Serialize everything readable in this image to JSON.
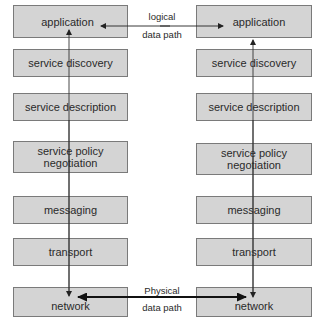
{
  "diagram": {
    "left_stack": {
      "layers": [
        {
          "label": "application"
        },
        {
          "label": "service discovery"
        },
        {
          "label": "service description"
        },
        {
          "label": "service policy\nnegotiation"
        },
        {
          "label": "messaging"
        },
        {
          "label": "transport"
        },
        {
          "label": "network"
        }
      ]
    },
    "right_stack": {
      "layers": [
        {
          "label": "application"
        },
        {
          "label": "service discovery"
        },
        {
          "label": "service description"
        },
        {
          "label": "service policy\nnegotiation"
        },
        {
          "label": "messaging"
        },
        {
          "label": "transport"
        },
        {
          "label": "network"
        }
      ]
    },
    "logical_path": {
      "line1": "logical",
      "line2": "data path"
    },
    "physical_path": {
      "line1": "Physical",
      "line2": "data path"
    },
    "colors": {
      "box_fill": "#d4d4d4",
      "box_border": "#7a7a7a",
      "line": "#222222"
    }
  }
}
